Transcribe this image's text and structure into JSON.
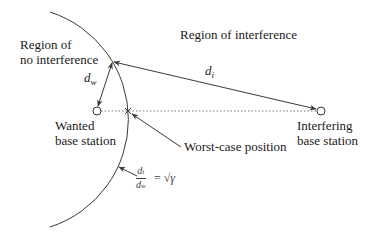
{
  "diagram": {
    "regions": {
      "no_interference": [
        "Region of",
        "no interference"
      ],
      "interference": "Region of interference"
    },
    "stations": {
      "wanted": [
        "Wanted",
        "base station"
      ],
      "interfering": [
        "Interfering",
        "base station"
      ]
    },
    "distances": {
      "d_w": {
        "symbol": "d",
        "subscript": "w"
      },
      "d_i": {
        "symbol": "d",
        "subscript": "i"
      }
    },
    "worst_case_label": "Worst-case position",
    "ratio_label": {
      "numerator": "d_i",
      "denominator": "d_w",
      "equals": "=",
      "rhs": "√γ"
    },
    "colors": {
      "line": "#3a3a3a",
      "dotted": "#777777",
      "text": "#1a1a1a"
    }
  }
}
